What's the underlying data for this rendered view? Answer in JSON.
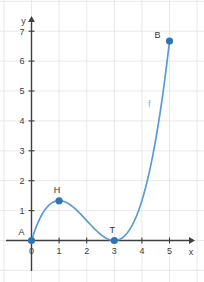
{
  "chart_data": {
    "type": "line",
    "title": "",
    "xlabel": "x",
    "ylabel": "y",
    "xlim": [
      -0.45,
      5.9
    ],
    "ylim": [
      -1.0,
      7.45
    ],
    "grid": true,
    "legend": null,
    "function_label": "f",
    "function_expression": "f(x) = (1/3)·x·(x-3)^2",
    "xticks": [
      0,
      1,
      2,
      3,
      4,
      5
    ],
    "xticklabels": [
      "0",
      "1",
      "2",
      "3",
      "4",
      "5"
    ],
    "yticks": [
      1,
      2,
      3,
      4,
      5,
      6,
      7
    ],
    "yticklabels": [
      "1",
      "2",
      "3",
      "4",
      "5",
      "6",
      "7"
    ],
    "series": [
      {
        "name": "f",
        "color": "#5b9bd5",
        "x": [
          0.0,
          0.1,
          0.2,
          0.3,
          0.4,
          0.5,
          0.6,
          0.7,
          0.8,
          0.9,
          1.0,
          1.1,
          1.2,
          1.3,
          1.4,
          1.5,
          1.6,
          1.7,
          1.8,
          1.9,
          2.0,
          2.1,
          2.2,
          2.3,
          2.4,
          2.5,
          2.6,
          2.7,
          2.8,
          2.9,
          3.0,
          3.1,
          3.2,
          3.3,
          3.4,
          3.5,
          3.6,
          3.7,
          3.8,
          3.9,
          4.0,
          4.1,
          4.2,
          4.3,
          4.4,
          4.5,
          4.6,
          4.7,
          4.8,
          4.9,
          5.0
        ],
        "y": [
          0.0,
          0.28,
          0.51,
          0.69,
          0.81,
          0.9,
          0.96,
          0.98,
          0.99,
          0.97,
          1.33,
          1.3,
          1.25,
          1.18,
          1.09,
          1.0,
          0.9,
          0.79,
          0.68,
          0.57,
          0.47,
          0.37,
          0.29,
          0.21,
          0.14,
          0.08,
          0.04,
          0.01,
          0.0,
          0.0,
          0.0,
          0.01,
          0.04,
          0.11,
          0.21,
          0.35,
          0.53,
          0.74,
          1.0,
          1.29,
          1.62,
          1.99,
          2.41,
          2.87,
          3.37,
          3.91,
          4.51,
          5.15,
          5.83,
          6.56,
          6.67
        ]
      }
    ],
    "points": [
      {
        "label": "A",
        "x": 0,
        "y": 0,
        "label_dx": -10,
        "label_dy": -6,
        "color": "#2e75b6"
      },
      {
        "label": "H",
        "x": 1,
        "y": 1.33,
        "label_dx": -2,
        "label_dy": -8,
        "color": "#2e75b6"
      },
      {
        "label": "T",
        "x": 3,
        "y": 0,
        "label_dx": -2,
        "label_dy": -8,
        "color": "#2e75b6"
      },
      {
        "label": "B",
        "x": 5,
        "y": 6.67,
        "label_dx": -12,
        "label_dy": -3,
        "color": "#2e75b6"
      }
    ],
    "colors": {
      "curve": "#5b9bd5",
      "marker": "#2e75b6",
      "function_label": "#7ab2e0",
      "axis": "#3f3f3f",
      "grid": "#e3e3e3",
      "background": "#ffffff",
      "tick_text": "#404040"
    }
  }
}
